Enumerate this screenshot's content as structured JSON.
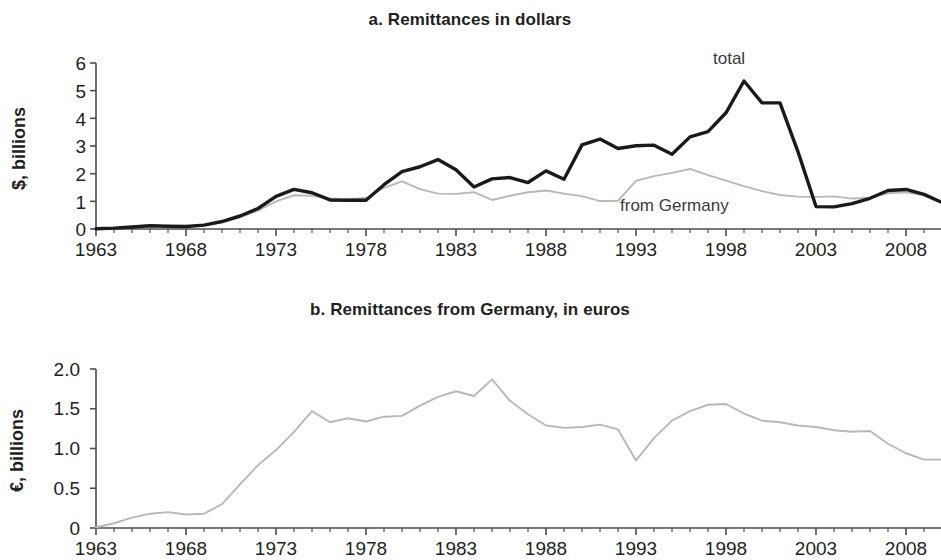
{
  "figure": {
    "background": "#ffffff",
    "total_color": "#1a1a1a",
    "germany_color": "#b8b8b8",
    "axis_color": "#4d4d4d"
  },
  "panel_a": {
    "title": "a. Remittances in dollars",
    "ylabel": "$, billions",
    "annotation_total": "total",
    "annotation_germany": "from Germany",
    "yticks": [
      "0",
      "1",
      "2",
      "3",
      "4",
      "5",
      "6"
    ],
    "xticks": [
      "1963",
      "1968",
      "1973",
      "1978",
      "1983",
      "1988",
      "1993",
      "1998",
      "2003",
      "2008"
    ]
  },
  "panel_b": {
    "title": "b. Remittances from Germany, in euros",
    "ylabel": "€, billions",
    "yticks": [
      "0",
      "0.5",
      "1.0",
      "1.5",
      "2.0"
    ],
    "xticks": [
      "1963",
      "1968",
      "1973",
      "1978",
      "1983",
      "1988",
      "1993",
      "1998",
      "2003",
      "2008"
    ]
  },
  "chart_data": [
    {
      "type": "line",
      "id": "panel-a",
      "title": "a. Remittances in dollars",
      "xlabel": "",
      "ylabel": "$, billions",
      "xlim": [
        1963,
        2010
      ],
      "ylim": [
        0,
        6
      ],
      "ytick_values": [
        0,
        1,
        2,
        3,
        4,
        5,
        6
      ],
      "xtick_values": [
        1963,
        1968,
        1973,
        1978,
        1983,
        1988,
        1993,
        1998,
        2003,
        2008
      ],
      "grid": false,
      "legend": "inline-annotations",
      "x": [
        1963,
        1964,
        1965,
        1966,
        1967,
        1968,
        1969,
        1970,
        1971,
        1972,
        1973,
        1974,
        1975,
        1976,
        1977,
        1978,
        1979,
        1980,
        1981,
        1982,
        1983,
        1984,
        1985,
        1986,
        1987,
        1988,
        1989,
        1990,
        1991,
        1992,
        1993,
        1994,
        1995,
        1996,
        1997,
        1998,
        1999,
        2000,
        2001,
        2002,
        2003,
        2004,
        2005,
        2006,
        2007,
        2008,
        2009,
        2010
      ],
      "series": [
        {
          "name": "total",
          "color": "#1a1a1a",
          "values": [
            0.01,
            0.03,
            0.07,
            0.12,
            0.1,
            0.09,
            0.14,
            0.27,
            0.47,
            0.74,
            1.18,
            1.43,
            1.31,
            1.05,
            1.04,
            1.04,
            1.6,
            2.07,
            2.25,
            2.51,
            2.14,
            1.52,
            1.81,
            1.86,
            1.68,
            2.1,
            1.8,
            3.04,
            3.25,
            2.91,
            3.01,
            3.03,
            2.7,
            3.33,
            3.52,
            4.2,
            5.35,
            4.56,
            4.56,
            2.79,
            0.81,
            0.8,
            0.92,
            1.11,
            1.39,
            1.43,
            1.25,
            0.96
          ]
        },
        {
          "name": "from Germany",
          "color": "#b8b8b8",
          "values": [
            0.01,
            0.03,
            0.07,
            0.12,
            0.1,
            0.09,
            0.13,
            0.25,
            0.42,
            0.66,
            1.0,
            1.22,
            1.2,
            1.1,
            1.08,
            1.12,
            1.49,
            1.72,
            1.44,
            1.28,
            1.27,
            1.33,
            1.05,
            1.2,
            1.33,
            1.39,
            1.28,
            1.19,
            1.01,
            1.02,
            1.74,
            1.91,
            2.03,
            2.17,
            1.95,
            1.75,
            1.55,
            1.37,
            1.23,
            1.17,
            1.16,
            1.18,
            1.1,
            1.13,
            1.29,
            1.33,
            1.22,
            0.96
          ]
        }
      ]
    },
    {
      "type": "line",
      "id": "panel-b",
      "title": "b. Remittances from Germany, in euros",
      "xlabel": "",
      "ylabel": "€, billions",
      "xlim": [
        1963,
        2010
      ],
      "ylim": [
        0,
        2.0
      ],
      "ytick_values": [
        0,
        0.5,
        1.0,
        1.5,
        2.0
      ],
      "xtick_values": [
        1963,
        1968,
        1973,
        1978,
        1983,
        1988,
        1993,
        1998,
        2003,
        2008
      ],
      "grid": false,
      "legend": "none",
      "x": [
        1963,
        1964,
        1965,
        1966,
        1967,
        1968,
        1969,
        1970,
        1971,
        1972,
        1973,
        1974,
        1975,
        1976,
        1977,
        1978,
        1979,
        1980,
        1981,
        1982,
        1983,
        1984,
        1985,
        1986,
        1987,
        1988,
        1989,
        1990,
        1991,
        1992,
        1993,
        1994,
        1995,
        1996,
        1997,
        1998,
        1999,
        2000,
        2001,
        2002,
        2003,
        2004,
        2005,
        2006,
        2007,
        2008,
        2009,
        2010
      ],
      "series": [
        {
          "name": "from Germany",
          "color": "#b8b8b8",
          "values": [
            0.01,
            0.06,
            0.13,
            0.18,
            0.2,
            0.17,
            0.18,
            0.3,
            0.55,
            0.79,
            0.98,
            1.21,
            1.47,
            1.33,
            1.38,
            1.34,
            1.4,
            1.41,
            1.54,
            1.65,
            1.72,
            1.66,
            1.87,
            1.6,
            1.43,
            1.29,
            1.26,
            1.27,
            1.3,
            1.24,
            0.85,
            1.13,
            1.35,
            1.47,
            1.55,
            1.56,
            1.44,
            1.35,
            1.33,
            1.29,
            1.27,
            1.23,
            1.21,
            1.22,
            1.06,
            0.94,
            0.86,
            0.86
          ]
        }
      ]
    }
  ]
}
